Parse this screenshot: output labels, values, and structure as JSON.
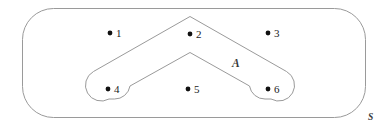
{
  "figure": {
    "type": "set-venn-diagram",
    "background_color": "#ffffff",
    "stroke_color": "#9a9a9a",
    "dot_color": "#111111",
    "label_color": "#1a1a1a",
    "set_label_color": "#3a3a3a"
  },
  "universal_set": {
    "name": "universal-set-S",
    "label": "S",
    "label_x": 368,
    "label_y": 113,
    "shape": {
      "x": 22.5,
      "y": 8.5,
      "width": 343,
      "height": 109,
      "corner_radius": 31
    }
  },
  "subset": {
    "name": "subset-A",
    "label": "A",
    "label_x": 232,
    "label_y": 58,
    "members": [
      2,
      4,
      6
    ],
    "shape_path": "M 190 16.5 L 286.5 71.5 A 15.5 15.5 0 0 1 271 99 L 265 99 A 15.5 15.5 0 0 1 249.5 86 L 190 52.5 L 130 86 A 15.5 15.5 0 0 1 114.5 99 L 109 99 A 15.5 15.5 0 0 1 93.5 71.5 Z"
  },
  "elements": [
    {
      "id": "element-1",
      "label": "1",
      "dot_x": 110,
      "dot_y": 33,
      "label_x": 116,
      "label_y": 28,
      "in_subset": false
    },
    {
      "id": "element-2",
      "label": "2",
      "dot_x": 190,
      "dot_y": 34,
      "label_x": 196,
      "label_y": 29,
      "in_subset": true
    },
    {
      "id": "element-3",
      "label": "3",
      "dot_x": 268,
      "dot_y": 33,
      "label_x": 274,
      "label_y": 28,
      "in_subset": false
    },
    {
      "id": "element-4",
      "label": "4",
      "dot_x": 108,
      "dot_y": 89,
      "label_x": 114,
      "label_y": 84,
      "in_subset": true
    },
    {
      "id": "element-5",
      "label": "5",
      "dot_x": 188,
      "dot_y": 89,
      "label_x": 194,
      "label_y": 84,
      "in_subset": false
    },
    {
      "id": "element-6",
      "label": "6",
      "dot_x": 268,
      "dot_y": 89,
      "label_x": 274,
      "label_y": 84,
      "in_subset": true
    }
  ]
}
